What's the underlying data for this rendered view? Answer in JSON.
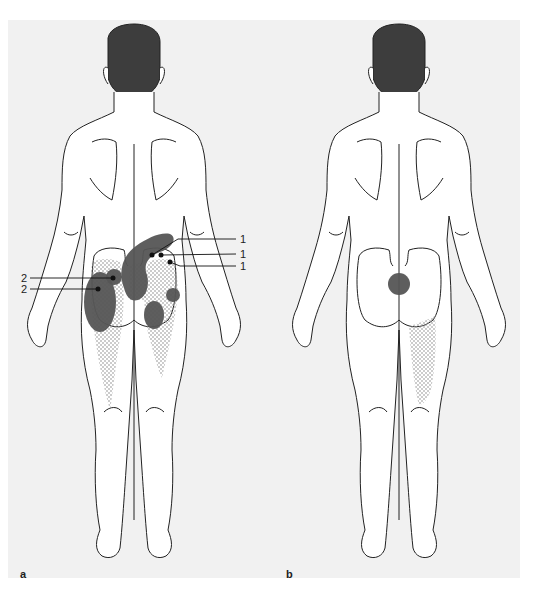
{
  "figure": {
    "panels": [
      {
        "id": "a",
        "label": "a",
        "view": "posterior",
        "markers": [
          {
            "type": "point",
            "label": "1"
          },
          {
            "type": "point",
            "label": "1"
          },
          {
            "type": "point",
            "label": "1"
          },
          {
            "type": "point",
            "label": "2"
          },
          {
            "type": "point",
            "label": "2"
          }
        ],
        "zones": [
          "dark lumbar-sacral band",
          "dark left lateral buttock/hip",
          "dark right buttock",
          "dark right lateral hip",
          "stippled buttocks and posterior thighs"
        ]
      },
      {
        "id": "b",
        "label": "b",
        "view": "posterior",
        "zones": [
          "dark sacral circle",
          "stippled right posterior thigh"
        ]
      }
    ],
    "callouts": {
      "c1a": "1",
      "c1b": "1",
      "c1c": "1",
      "c2a": "2",
      "c2b": "2"
    },
    "colors": {
      "background": "#f1f1f1",
      "outline": "#222222",
      "hair": "#3d3d3d",
      "dark_zone": "#555555",
      "stipple": "#8a8a8a"
    }
  }
}
